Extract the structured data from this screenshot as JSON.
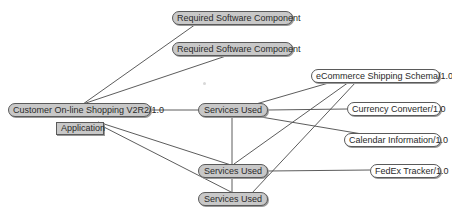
{
  "diagram": {
    "colors": {
      "edge": "#4a4a4a",
      "filled_node": "#c8c8c8",
      "plain_node": "#ffffff",
      "border": "#5a5a5a"
    },
    "nodes": {
      "req1": {
        "label": "Required Software Component",
        "style": "filled"
      },
      "req2": {
        "label": "Required Software Component",
        "style": "filled"
      },
      "customer": {
        "label": "Customer On-line Shopping V2R2/1.0",
        "style": "filled"
      },
      "application": {
        "label": "Application",
        "style": "box"
      },
      "services1": {
        "label": "Services Used",
        "style": "filled"
      },
      "services2": {
        "label": "Services Used",
        "style": "filled"
      },
      "services3": {
        "label": "Services Used",
        "style": "filled"
      },
      "ecommerce": {
        "label": "eCommerce Shipping Schema/1.0",
        "style": "plain"
      },
      "currency": {
        "label": "Currency Converter/1.0",
        "style": "plain"
      },
      "calendar": {
        "label": "Calendar Information/1.0",
        "style": "plain"
      },
      "fedex": {
        "label": "FedEx Tracker/1.0",
        "style": "plain"
      }
    },
    "edges": [
      [
        "customer",
        "req1"
      ],
      [
        "customer",
        "req2"
      ],
      [
        "customer",
        "services1"
      ],
      [
        "customer",
        "services2"
      ],
      [
        "customer",
        "services3"
      ],
      [
        "services1",
        "ecommerce"
      ],
      [
        "services1",
        "currency"
      ],
      [
        "services1",
        "calendar"
      ],
      [
        "services1",
        "services2"
      ],
      [
        "services2",
        "ecommerce"
      ],
      [
        "services2",
        "fedex"
      ],
      [
        "services2",
        "services3"
      ],
      [
        "services3",
        "ecommerce"
      ]
    ]
  }
}
